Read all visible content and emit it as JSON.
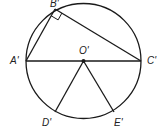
{
  "diagram": {
    "type": "circle-geometry",
    "labels": {
      "B": "B'",
      "A": "A'",
      "C": "C'",
      "O": "O'",
      "D": "D'",
      "E": "E'"
    },
    "stroke_color": "#1a1a1a"
  }
}
